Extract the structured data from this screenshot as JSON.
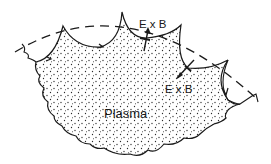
{
  "diagram": {
    "labels": {
      "exb_top": "E x B",
      "exb_right": "E x B",
      "plasma": "Plasma"
    },
    "colors": {
      "ink": "#1a1a1a",
      "background": "#ffffff",
      "stipple": "#2a2a2a"
    },
    "elements": {
      "outer_boundary": "dashed arc (wall / separatrix)",
      "plasma_region": "stippled region with scalloped top edge and wavy lower edge",
      "flux_lobes": 4,
      "drift_arrows": 2
    }
  }
}
